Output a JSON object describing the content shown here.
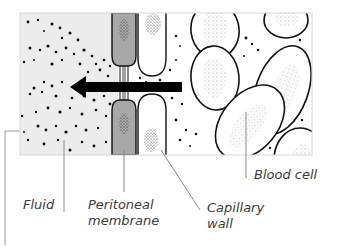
{
  "diagram": {
    "arrow_direction": "left",
    "colors": {
      "fluid_bg": "#ececec",
      "membrane_fill": "#a8a8a8",
      "outline": "#111111",
      "leader_line": "#8a8a8a",
      "label_text": "#3a3a3a"
    }
  },
  "labels": {
    "fluid": "Fluid",
    "peritoneal_line1": "Peritoneal",
    "peritoneal_line2": "membrane",
    "capillary_line1": "Capillary",
    "capillary_line2": "wall",
    "blood_cell": "Blood cell"
  }
}
